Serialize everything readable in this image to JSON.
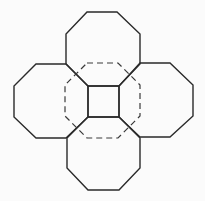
{
  "figure": {
    "width": 205,
    "height": 201,
    "background": "#fbfbfb",
    "stroke_color": "#2a2a2a",
    "dashed_color": "#3a3a3a"
  },
  "shapes": {
    "octagon_top": {
      "style": "solid",
      "points": "87,12 117,12 140,34 140,64 119,86 88,86 66,64 66,34"
    },
    "octagon_left": {
      "style": "solid",
      "points": "36,64 66,64 88,86 88,117 66,138 36,138 14,117 14,86"
    },
    "octagon_right": {
      "style": "solid",
      "points": "140,63 170,63 193,85 193,116 170,137 140,137 119,117 119,86"
    },
    "octagon_bottom": {
      "style": "solid",
      "points": "88,117 119,117 140,138 140,168 119,190 88,190 67,168 67,138"
    },
    "center_square": {
      "style": "solid",
      "points": "88,86 119,86 119,117 88,117"
    },
    "octagon_center_dashed": {
      "style": "dashed",
      "points": "87,63 118,63 140,85 140,116 118,138 87,138 65,116 65,85"
    }
  }
}
